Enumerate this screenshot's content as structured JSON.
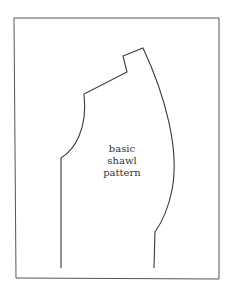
{
  "diagram": {
    "label_lines": [
      "basic",
      "shawl",
      "pattern"
    ],
    "stroke_color": "#3a3a3a",
    "background": "#ffffff"
  }
}
